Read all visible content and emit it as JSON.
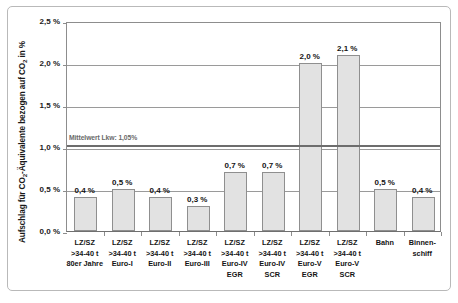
{
  "chart_data": {
    "type": "bar",
    "title": "",
    "subtitle": "",
    "xlabel": "",
    "ylabel": "Aufschlag für CO₂-Äquivalente bezogen auf CO₂ in %",
    "ylim": [
      0.0,
      2.5
    ],
    "grid": true,
    "legend": "none",
    "ytick_labels": [
      "2,5 %",
      "2,0 %",
      "1,5 %",
      "1,0 %",
      "0,5 %",
      "0,0 %"
    ],
    "ytick_values": [
      2.5,
      2.0,
      1.5,
      1.0,
      0.5,
      0.0
    ],
    "categories": [
      "LZ/SZ >34-40 t 80er Jahre",
      "LZ/SZ >34-40 t Euro-I",
      "LZ/SZ >34-40 t Euro-II",
      "LZ/SZ >34-40 t Euro-III",
      "LZ/SZ >34-40 t Euro-IV EGR",
      "LZ/SZ >34-40 t Euro-IV SCR",
      "LZ/SZ >34-40 t Euro-V EGR",
      "LZ/SZ >34-40 t Euro-V SCR",
      "Bahn",
      "Binnenschiff"
    ],
    "category_lines": [
      [
        "LZ/SZ",
        ">34-40 t",
        "80er Jahre"
      ],
      [
        "LZ/SZ",
        ">34-40 t",
        "Euro-I"
      ],
      [
        "LZ/SZ",
        ">34-40 t",
        "Euro-II"
      ],
      [
        "LZ/SZ",
        ">34-40 t",
        "Euro-III"
      ],
      [
        "LZ/SZ",
        ">34-40 t",
        "Euro-IV",
        "EGR"
      ],
      [
        "LZ/SZ",
        ">34-40 t",
        "Euro-IV",
        "SCR"
      ],
      [
        "LZ/SZ",
        ">34-40 t",
        "Euro-V",
        "EGR"
      ],
      [
        "LZ/SZ",
        ">34-40 t",
        "Euro-V",
        "SCR"
      ],
      [
        "Bahn"
      ],
      [
        "Binnen-",
        "schiff"
      ]
    ],
    "values": [
      0.4,
      0.5,
      0.4,
      0.3,
      0.7,
      0.7,
      2.0,
      2.1,
      0.5,
      0.4
    ],
    "value_labels": [
      "0,4 %",
      "0,5 %",
      "0,4 %",
      "0,3 %",
      "0,7 %",
      "0,7 %",
      "2,0 %",
      "2,1 %",
      "0,5 %",
      "0,4 %"
    ],
    "reference_line": {
      "label": "Mittelwert Lkw: 1,05%",
      "value": 1.05
    },
    "colors": {
      "bar_fill": "#e2e2e2",
      "bar_border": "#8f8f8f",
      "gridline": "#9a9a9a",
      "reference_line": "#6d6d6d",
      "axis": "#8d8d8d",
      "text": "#141414",
      "frame": "#b9b9b9",
      "background": "#ffffff"
    }
  }
}
